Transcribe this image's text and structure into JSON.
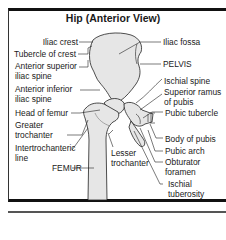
{
  "diagram": {
    "title": "Hip (Anterior View)",
    "left_labels": [
      {
        "id": "iliac-crest",
        "lines": [
          "Iliac crest"
        ]
      },
      {
        "id": "tubercle-of-crest",
        "lines": [
          "Tubercle of crest"
        ]
      },
      {
        "id": "anterior-superior-iliac-spine",
        "lines": [
          "Anterior superior",
          "iliac spine"
        ]
      },
      {
        "id": "anterior-inferior-iliac-spine",
        "lines": [
          "Anterior inferior",
          "iliac spine"
        ]
      },
      {
        "id": "head-of-femur",
        "lines": [
          "Head of femur"
        ]
      },
      {
        "id": "greater-trochanter",
        "lines": [
          "Greater",
          "trochanter"
        ]
      },
      {
        "id": "intertrochanteric-line",
        "lines": [
          "Intertrochanteric",
          "line"
        ]
      },
      {
        "id": "femur",
        "lines": [
          "FEMUR"
        ]
      },
      {
        "id": "lesser-trochanter",
        "lines": [
          "Lesser",
          "trochanter"
        ]
      }
    ],
    "right_labels": [
      {
        "id": "iliac-fossa",
        "lines": [
          "Iliac fossa"
        ]
      },
      {
        "id": "pelvis",
        "lines": [
          "PELVIS"
        ]
      },
      {
        "id": "ischial-spine",
        "lines": [
          "Ischial spine"
        ]
      },
      {
        "id": "superior-ramus-of-pubis",
        "lines": [
          "Superior ramus",
          "of pubis"
        ]
      },
      {
        "id": "pubic-tubercle",
        "lines": [
          "Pubic tubercle"
        ]
      },
      {
        "id": "body-of-pubis",
        "lines": [
          "Body of pubis"
        ]
      },
      {
        "id": "pubic-arch",
        "lines": [
          "Pubic arch"
        ]
      },
      {
        "id": "obturator-foramen",
        "lines": [
          "Obturator",
          "foramen"
        ]
      },
      {
        "id": "ischial-tuberosity",
        "lines": [
          "Ischial",
          "tuberosity"
        ]
      }
    ],
    "colors": {
      "bone_fill": "#e6e6e6",
      "outline": "#222222",
      "frame": "#111111"
    }
  }
}
